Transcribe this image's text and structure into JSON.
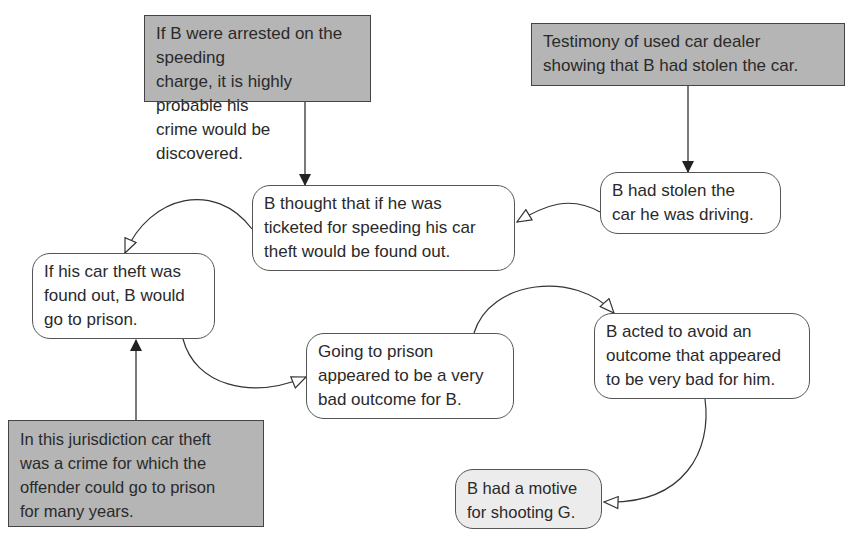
{
  "diagram": {
    "type": "argument-map",
    "nodes": [
      {
        "id": "evidence_arrest",
        "kind": "premise",
        "text": "If B were arrested on the speeding\ncharge, it is highly probable his\ncrime would be discovered."
      },
      {
        "id": "evidence_dealer",
        "kind": "premise",
        "text": "Testimony of used car dealer\nshowing that B had stolen the car."
      },
      {
        "id": "thought_found_out",
        "kind": "claim",
        "text": "B thought that if he was\nticketed for speeding his car\ntheft would be found out."
      },
      {
        "id": "stolen_car",
        "kind": "claim",
        "text": "B had stolen the\ncar he was driving."
      },
      {
        "id": "go_to_prison",
        "kind": "claim",
        "text": "If his car theft was\nfound out, B would\ngo to prison."
      },
      {
        "id": "bad_outcome",
        "kind": "claim",
        "text": "Going to prison\nappeared to be a very\nbad outcome for B."
      },
      {
        "id": "acted_to_avoid",
        "kind": "claim",
        "text": "B acted to avoid an\noutcome that appeared\nto be very bad for him."
      },
      {
        "id": "jurisdiction_law",
        "kind": "premise",
        "text": "In this jurisdiction car theft\nwas a crime for which the\noffender could go to prison\nfor many years."
      },
      {
        "id": "motive",
        "kind": "conclusion",
        "text": "B had a motive\nfor shooting G."
      }
    ],
    "edges": [
      {
        "from": "evidence_arrest",
        "to": "thought_found_out",
        "style": "solid-arrow"
      },
      {
        "from": "evidence_dealer",
        "to": "stolen_car",
        "style": "solid-arrow"
      },
      {
        "from": "stolen_car",
        "to": "thought_found_out",
        "style": "hollow-arrow"
      },
      {
        "from": "thought_found_out",
        "to": "go_to_prison",
        "style": "hollow-arrow"
      },
      {
        "from": "jurisdiction_law",
        "to": "go_to_prison",
        "style": "solid-arrow"
      },
      {
        "from": "go_to_prison",
        "to": "bad_outcome",
        "style": "hollow-arrow"
      },
      {
        "from": "bad_outcome",
        "to": "acted_to_avoid",
        "style": "hollow-arrow"
      },
      {
        "from": "acted_to_avoid",
        "to": "motive",
        "style": "hollow-arrow"
      }
    ],
    "colors": {
      "premise_fill": "#b5b5b5",
      "claim_fill": "#ffffff",
      "conclusion_fill": "#ececec",
      "stroke": "#444444"
    }
  }
}
